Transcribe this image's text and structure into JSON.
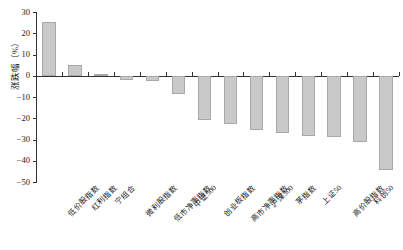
{
  "chart_data": {
    "type": "bar",
    "title": "",
    "subtitle": "",
    "xlabel": "",
    "ylabel": "涨跌幅（%）",
    "ylim": [
      -50,
      30
    ],
    "yticks": [
      30,
      20,
      10,
      0,
      -10,
      -20,
      -30,
      -40,
      -50
    ],
    "ytick_labels": [
      "30",
      "20",
      "10",
      "0",
      "−10",
      "−20",
      "−30",
      "−40",
      "−50"
    ],
    "grid": false,
    "legend": "none",
    "bar_color": "#c9c9c9",
    "bar_edge_color": "#a8a8a8",
    "axis_color": "#333333",
    "categories": [
      "低价股指数",
      "红利指数",
      "宁组合",
      "微利股指数",
      "低市净率指数",
      "中证500",
      "创业板指数",
      "高市净率指数",
      "沪深300",
      "茅指数",
      "上证50",
      "高价股指数",
      "科创50",
      "绩优股指数"
    ],
    "values": [
      25.3,
      4.9,
      0.7,
      -1.8,
      -2.3,
      -8.5,
      -20.8,
      -22.6,
      -25.7,
      -26.8,
      -28.2,
      -28.9,
      -31.2,
      -44.2
    ]
  }
}
